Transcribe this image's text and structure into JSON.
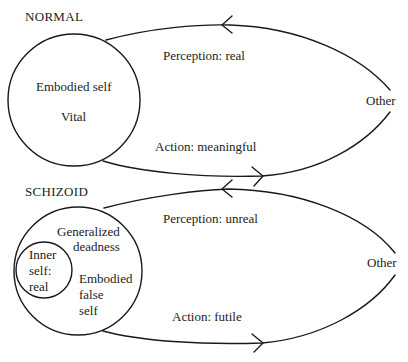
{
  "normal": {
    "heading": "NORMAL",
    "self_label": "Embodied self",
    "self_state": "Vital",
    "perception": "Perception: real",
    "action": "Action: meaningful",
    "other": "Other"
  },
  "schizoid": {
    "heading": "SCHIZOID",
    "outer_label_line1": "Generalized",
    "outer_label_line2": "deadness",
    "inner_line1": "Inner",
    "inner_line2": "self:",
    "inner_line3": "real",
    "false_line1": "Embodied",
    "false_line2": "false",
    "false_line3": "self",
    "perception": "Perception: unreal",
    "action": "Action: futile",
    "other": "Other"
  },
  "colors": {
    "stroke": "#1a1a1a",
    "background": "#ffffff"
  }
}
